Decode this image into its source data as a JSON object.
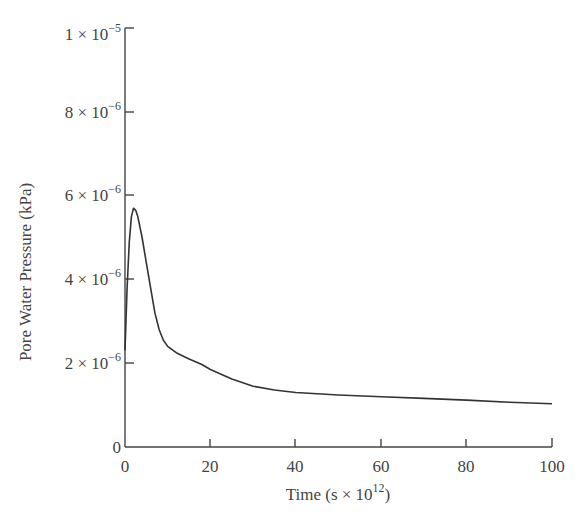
{
  "chart_data": {
    "type": "line",
    "title": "",
    "xlabel": "Time (s × 10^12)",
    "ylabel": "Pore Water Pressure (kPa)",
    "xlim": [
      0,
      100
    ],
    "ylim": [
      0,
      1e-05
    ],
    "grid": false,
    "legend": null,
    "x_ticks": [
      "0",
      "20",
      "40",
      "60",
      "80",
      "100"
    ],
    "y_ticks": [
      "0",
      "2 × 10⁻⁶",
      "4 × 10⁻⁶",
      "6 × 10⁻⁶",
      "8 × 10⁻⁶",
      "1 × 10⁻⁵"
    ],
    "series": [
      {
        "name": "Pore water pressure",
        "x": [
          0,
          0.5,
          1,
          1.5,
          2,
          2.5,
          3,
          4,
          5,
          6,
          7,
          8,
          9,
          10,
          12,
          15,
          18,
          20,
          25,
          30,
          35,
          40,
          50,
          60,
          70,
          80,
          90,
          100
        ],
        "values": [
          2.3e-06,
          3.8e-06,
          4.9e-06,
          5.5e-06,
          5.7e-06,
          5.65e-06,
          5.5e-06,
          5e-06,
          4.4e-06,
          3.8e-06,
          3.2e-06,
          2.8e-06,
          2.55e-06,
          2.4e-06,
          2.25e-06,
          2.1e-06,
          1.97e-06,
          1.85e-06,
          1.62e-06,
          1.45e-06,
          1.36e-06,
          1.3e-06,
          1.24e-06,
          1.2e-06,
          1.16e-06,
          1.12e-06,
          1.07e-06,
          1.03e-06
        ]
      }
    ]
  },
  "labels": {
    "xlabel_main": "Time (s × 10",
    "xlabel_sup": "12",
    "xlabel_end": ")",
    "ylabel": "Pore Water Pressure (kPa)",
    "y_ticks": [
      {
        "mant": "0",
        "exp": ""
      },
      {
        "mant": "2 × 10",
        "exp": "−6"
      },
      {
        "mant": "4 × 10",
        "exp": "−6"
      },
      {
        "mant": "6 × 10",
        "exp": "−6"
      },
      {
        "mant": "8 × 10",
        "exp": "−6"
      },
      {
        "mant": "1 × 10",
        "exp": "−5"
      }
    ],
    "x_ticks": [
      "0",
      "20",
      "40",
      "60",
      "80",
      "100"
    ]
  }
}
